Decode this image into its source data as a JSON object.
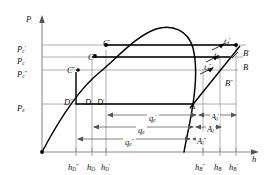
{
  "figure": {
    "type": "pressure-enthalpy-diagram",
    "axes": {
      "y_label": "P",
      "x_label": "h",
      "y_name": "pressure-axis",
      "x_name": "enthalpy-axis"
    },
    "pressure_ticks": [
      {
        "base": "P",
        "sub": "c",
        "prime": "′",
        "label": "Pc′",
        "y": 45
      },
      {
        "base": "P",
        "sub": "c",
        "prime": "",
        "label": "Pc",
        "y": 57
      },
      {
        "base": "P",
        "sub": "c",
        "prime": "″",
        "label": "Pc″",
        "y": 70
      },
      {
        "base": "P",
        "sub": "e",
        "prime": "",
        "label": "Pe",
        "y": 104
      }
    ],
    "enthalpy_ticks": [
      {
        "base": "h",
        "sub": "D",
        "prime": "″",
        "label": "hD″",
        "x": 76
      },
      {
        "base": "h",
        "sub": "D",
        "prime": "",
        "label": "hD",
        "x": 92
      },
      {
        "base": "h",
        "sub": "D",
        "prime": "′",
        "label": "hD′",
        "x": 106
      },
      {
        "base": "h",
        "sub": "B",
        "prime": "″",
        "label": "hB″",
        "x": 203
      },
      {
        "base": "h",
        "sub": "B",
        "prime": "",
        "label": "hB",
        "x": 220
      },
      {
        "base": "h",
        "sub": "B",
        "prime": "′",
        "label": "hB′",
        "x": 236
      }
    ],
    "state_points": [
      {
        "base": "C",
        "prime": "′",
        "label": "C′",
        "x": 110,
        "y": 50
      },
      {
        "base": "C",
        "prime": "",
        "label": "C",
        "x": 95,
        "y": 60
      },
      {
        "base": "C",
        "prime": "″",
        "label": "C″",
        "x": 77,
        "y": 72
      },
      {
        "base": "D",
        "prime": "″",
        "label": "D″",
        "x": 77,
        "y": 103
      },
      {
        "base": "D",
        "prime": "",
        "label": "D",
        "x": 93,
        "y": 103
      },
      {
        "base": "D",
        "prime": "′",
        "label": "D′",
        "x": 106,
        "y": 103
      },
      {
        "base": "A",
        "prime": "",
        "label": "A",
        "x": 193,
        "y": 104
      },
      {
        "base": "B",
        "prime": "′",
        "label": "B′",
        "x": 248,
        "y": 50
      },
      {
        "base": "B",
        "prime": "",
        "label": "B",
        "x": 248,
        "y": 64
      },
      {
        "base": "B",
        "prime": "″",
        "label": "B″",
        "x": 232,
        "y": 80
      }
    ],
    "temperature_labels": [
      {
        "base": "t",
        "sub": "d",
        "prime": "′",
        "label": "td′",
        "x": 228,
        "y": 38
      },
      {
        "base": "t",
        "sub": "d",
        "prime": "",
        "label": "td",
        "x": 219,
        "y": 52
      },
      {
        "base": "t",
        "sub": "d",
        "prime": "″",
        "label": "td″",
        "x": 209,
        "y": 64
      }
    ],
    "heat_spans": [
      {
        "base": "q",
        "sub": "e",
        "prime": "′",
        "label": "qe′",
        "x": 152,
        "y": 115
      },
      {
        "base": "q",
        "sub": "e",
        "prime": "",
        "label": "qe",
        "x": 140,
        "y": 127
      },
      {
        "base": "q",
        "sub": "e",
        "prime": "″",
        "label": "qe″",
        "x": 128,
        "y": 139
      }
    ],
    "work_spans": [
      {
        "base": "A",
        "sub": "l",
        "prime": "′",
        "label": "Al′",
        "x": 214,
        "y": 114
      },
      {
        "base": "A",
        "sub": "l",
        "prime": "",
        "label": "Al",
        "x": 213,
        "y": 126
      },
      {
        "base": "A",
        "sub": "l",
        "prime": "″",
        "label": "Al″",
        "x": 212,
        "y": 138
      }
    ],
    "colors": {
      "curve": "#000000",
      "guide": "#8c8c8c",
      "axis": "#8c8c8c",
      "text": "#111111"
    }
  }
}
